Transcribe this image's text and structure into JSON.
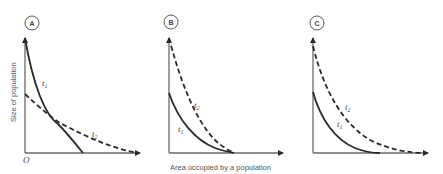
{
  "figure": {
    "y_axis_label": "Size of population",
    "x_axis_label": "Area occupied by a population",
    "origin_label": "O",
    "panels": [
      {
        "id": "A",
        "curves": [
          {
            "label": "t",
            "subscript": "1",
            "style": "solid"
          },
          {
            "label": "t",
            "subscript": "2",
            "style": "dashed"
          }
        ]
      },
      {
        "id": "B",
        "curves": [
          {
            "label": "t",
            "subscript": "1",
            "style": "solid"
          },
          {
            "label": "t",
            "subscript": "2",
            "style": "dashed"
          }
        ]
      },
      {
        "id": "C",
        "curves": [
          {
            "label": "t",
            "subscript": "1",
            "style": "solid"
          },
          {
            "label": "t",
            "subscript": "2",
            "style": "dashed"
          }
        ]
      }
    ]
  }
}
